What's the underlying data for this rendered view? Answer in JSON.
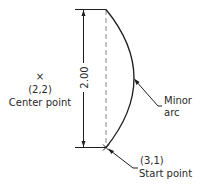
{
  "diagram": {
    "dimension": {
      "label": "2.00"
    },
    "center_point": {
      "marker": "×",
      "coords": "(2,2)",
      "label": "Center point"
    },
    "arc": {
      "label_line1": "Minor",
      "label_line2": "arc"
    },
    "start_point": {
      "coords": "(3,1)",
      "label": "Start point"
    }
  }
}
